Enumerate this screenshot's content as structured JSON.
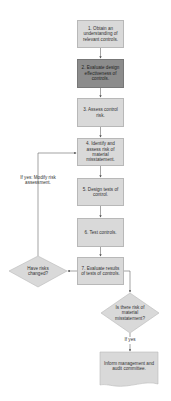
{
  "diagram": {
    "steps": [
      {
        "id": 1,
        "label": "1. Obtain an understanding of relevant controls."
      },
      {
        "id": 2,
        "label": "2. Evaluate design effectiveness of controls."
      },
      {
        "id": 3,
        "label": "3. Assess control risk."
      },
      {
        "id": 4,
        "label": "4. Identify and assess risk of material misstatement."
      },
      {
        "id": 5,
        "label": "5. Design tests of control."
      },
      {
        "id": 6,
        "label": "6. Test controls."
      },
      {
        "id": 7,
        "label": "7. Evaluate results of tests of controls."
      }
    ],
    "decisions": {
      "risks_changed": "Have risks changed?",
      "material_misstatement": "Is there risk of material misstatement?"
    },
    "edge_labels": {
      "loop_back": "If yes: Modify risk assessment.",
      "if_yes": "If yes"
    },
    "document": {
      "label": "Inform management and audit committee."
    },
    "colors": {
      "box_fill": "#d9d9d9",
      "highlight_fill": "#8c8c8c",
      "line": "#666666"
    }
  }
}
